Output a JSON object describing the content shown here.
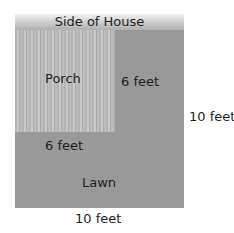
{
  "diagram": {
    "house_label": "Side of House",
    "porch_label": "Porch",
    "lawn_label": "Lawn",
    "porch_side_label": "6 feet",
    "porch_bottom_label": "6 feet",
    "yard_side_label": "10 feet",
    "yard_bottom_label": "10 feet",
    "colors": {
      "lawn": "#999999",
      "porch": "#bdbdbd",
      "house": "#c8c8c8"
    }
  }
}
